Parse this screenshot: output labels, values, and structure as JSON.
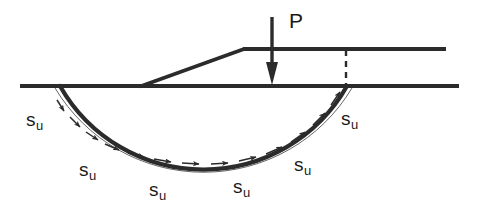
{
  "figure": {
    "type": "engineering-diagram",
    "width": 477,
    "height": 222,
    "background_color": "#ffffff",
    "line_color": "#2b2b2b"
  },
  "load": {
    "label": "P",
    "label_x": 292,
    "label_y": 12,
    "arrow_x": 272,
    "arrow_top_y": 17,
    "arrow_tip_y": 84,
    "description": "vertical downward point load on embankment crest"
  },
  "ground_line": {
    "name": "ground-surface",
    "x1": 20,
    "x2": 459,
    "y": 86
  },
  "crest_line": {
    "name": "embankment-crest",
    "x1": 243,
    "x2": 446,
    "y": 49
  },
  "slope_face": {
    "name": "embankment-slope",
    "x1": 140,
    "y1": 86,
    "x2": 243,
    "y2": 49
  },
  "dashed_line": {
    "name": "vertical-reference",
    "x": 346,
    "y1": 50,
    "y2": 86,
    "dash_pattern": "6 5"
  },
  "slip_circle": {
    "name": "failure-arc",
    "left_x": 60,
    "right_x": 347,
    "surface_y": 86,
    "lowest_y": 154,
    "center_x": 204,
    "center_y": 14,
    "radius": 165
  },
  "shear_labels": [
    {
      "symbol": "s",
      "subscript": "u",
      "x": 26,
      "y": 110
    },
    {
      "symbol": "s",
      "subscript": "u",
      "x": 79,
      "y": 160
    },
    {
      "symbol": "s",
      "subscript": "u",
      "x": 149,
      "y": 180
    },
    {
      "symbol": "s",
      "subscript": "u",
      "x": 233,
      "y": 177
    },
    {
      "symbol": "s",
      "subscript": "u",
      "x": 294,
      "y": 155
    },
    {
      "symbol": "s",
      "subscript": "u",
      "x": 341,
      "y": 109
    }
  ],
  "shear_arrows": {
    "count": 12,
    "direction": "counterclockwise along failure arc",
    "description": "undrained shear strength acting tangentially on the slip surface"
  }
}
